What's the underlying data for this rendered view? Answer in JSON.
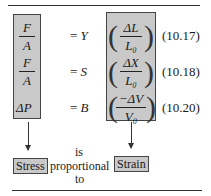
{
  "equations": [
    {
      "lhs_num": "F",
      "lhs_den": "A",
      "equals": "= ",
      "modulus": "Y",
      "rhs_num": "ΔL",
      "rhs_den": "L₀",
      "number": "(10.17)"
    },
    {
      "lhs_num": "F",
      "lhs_den": "A",
      "equals": "= ",
      "modulus": "S",
      "rhs_num": "ΔX",
      "rhs_den": "L₀",
      "number": "(10.18)"
    },
    {
      "lhs": "ΔP",
      "equals": "= ",
      "modulus": "B",
      "rhs_num": "−ΔV",
      "rhs_den": "V₀",
      "number": "(10.20)"
    }
  ],
  "caption": {
    "left_tag": "Stress",
    "middle_top": "is",
    "middle": "proportional",
    "middle_bottom": "to",
    "right_tag": "Strain"
  },
  "colors": {
    "box_fill": "#c9c9c9",
    "box_border": "#444444"
  }
}
